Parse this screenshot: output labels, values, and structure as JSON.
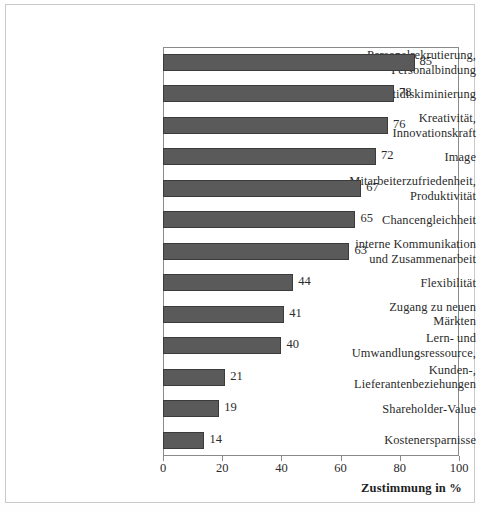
{
  "figure": {
    "background_color": "#ffffff",
    "frame_color": "#c9c9c9"
  },
  "chart_data": {
    "type": "bar",
    "orientation": "horizontal",
    "title": "",
    "subtitle": "",
    "xlabel": "Zustimmung in %",
    "ylabel": "",
    "xlim": [
      0,
      100
    ],
    "xticks": [
      0,
      20,
      40,
      60,
      80,
      100
    ],
    "xticklabels": [
      "0",
      "20",
      "40",
      "60",
      "80",
      "100"
    ],
    "grid": false,
    "legend": null,
    "bar_color": "#5a5a5a",
    "bar_edge_color": "#3b3b3b",
    "value_labels_shown": true,
    "categories": [
      "Personalrekrutierung, Personalbindung",
      "Antidiskiminierung",
      "Kreativität, Innovationskraft",
      "Image",
      "Mitarbeiterzufriedenheit, Produktivität",
      "Chancengleichheit",
      "interne Kommunikation und Zusammenarbeit",
      "Flexibilität",
      "Zugang zu neuen Märkten",
      "Lern- und Umwandlungsressource,",
      "Kunden-, Lieferantenbeziehungen",
      "Shareholder-Value",
      "Kostenersparnisse"
    ],
    "category_lines": [
      [
        "Personalrekrutierung,",
        "Personalbindung"
      ],
      [
        "Antidiskiminierung"
      ],
      [
        "Kreativität,",
        "Innovationskraft"
      ],
      [
        "Image"
      ],
      [
        "Mitarbeiterzufriedenheit,",
        "Produktivität"
      ],
      [
        "Chancengleichheit"
      ],
      [
        "interne Kommunikation",
        "und Zusammenarbeit"
      ],
      [
        "Flexibilität"
      ],
      [
        "Zugang zu neuen",
        "Märkten"
      ],
      [
        "Lern- und",
        "Umwandlungsressource,"
      ],
      [
        "Kunden-,",
        "Lieferantenbeziehungen"
      ],
      [
        "Shareholder-Value"
      ],
      [
        "Kostenersparnisse"
      ]
    ],
    "values": [
      85,
      78,
      76,
      72,
      67,
      65,
      63,
      44,
      41,
      40,
      21,
      19,
      14
    ],
    "value_label_texts": [
      "85",
      "78",
      "76",
      "72",
      "67",
      "65",
      "63",
      "44",
      "41",
      "40",
      "21",
      "19",
      "14"
    ]
  }
}
